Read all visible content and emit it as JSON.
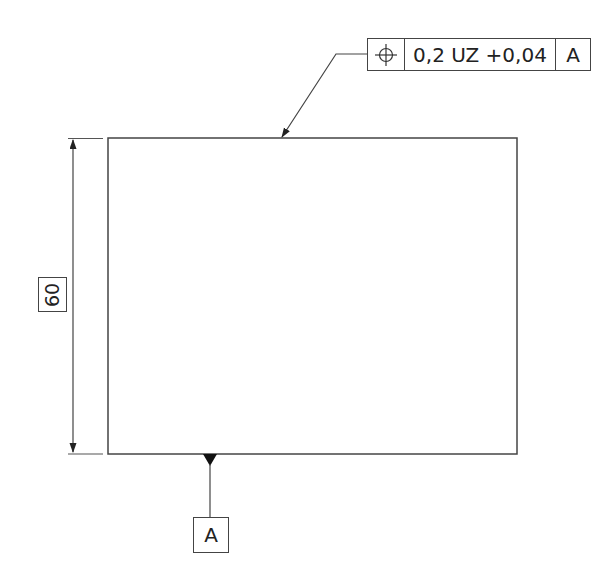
{
  "drawing": {
    "part": {
      "shape": "rectangle",
      "x": 108,
      "y": 138,
      "width": 409,
      "height": 316
    },
    "stroke_color": "#444444"
  },
  "feature_control_frame": {
    "symbol": "position-icon",
    "symbol_glyph": "⌖",
    "tolerance": "0,2 UZ +0,04",
    "datum_ref": "A"
  },
  "dimension": {
    "value": "60",
    "orientation": "vertical",
    "boxed": true
  },
  "datum": {
    "label": "A"
  }
}
